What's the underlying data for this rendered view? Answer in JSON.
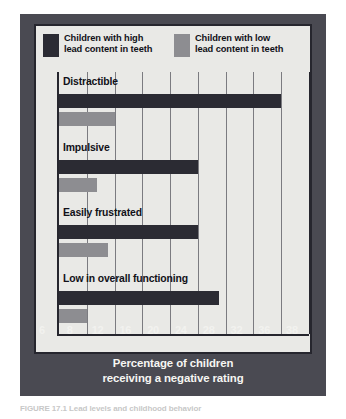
{
  "legend": {
    "entries": [
      {
        "label": "Children with high\nlead content in teeth",
        "color": "#2b2b33",
        "swatch_name": "legend-swatch-high-lead"
      },
      {
        "label": "Children with low\nlead content in teeth",
        "color": "#8d8d91",
        "swatch_name": "legend-swatch-low-lead"
      }
    ]
  },
  "axis": {
    "title": "Percentage of children\nreceiving a negative rating",
    "ticks": [
      "6",
      "8",
      "12",
      "16",
      "20",
      "24",
      "28",
      "32",
      "36",
      "38"
    ]
  },
  "caption": {
    "text": "FIGURE 17.1   Lead  levels  and  childhood  behavior"
  },
  "colors": {
    "panel": "#4a4a52",
    "plate": "#e9e9e6",
    "frame": "#26262e",
    "bar_high": "#2b2b33",
    "bar_low": "#8d8d91",
    "gridline": "#7b7b80",
    "tick_text": "#f2f2ef"
  },
  "chart_data": {
    "type": "bar",
    "orientation": "horizontal",
    "title": "",
    "xlabel": "Percentage of children receiving a negative rating",
    "ylabel": "",
    "xlim": [
      6,
      38
    ],
    "xticks": [
      6,
      8,
      12,
      16,
      20,
      24,
      28,
      32,
      36,
      38
    ],
    "grid": true,
    "legend_position": "top",
    "categories": [
      "Distractible",
      "Impulsive",
      "Easily frustrated",
      "Low in overall functioning"
    ],
    "series": [
      {
        "name": "Children with high lead content in teeth",
        "color": "#2b2b33",
        "values": [
          36,
          24,
          24,
          27
        ]
      },
      {
        "name": "Children with low lead content in teeth",
        "color": "#8d8d91",
        "values": [
          12,
          9.5,
          11,
          8
        ]
      }
    ]
  }
}
